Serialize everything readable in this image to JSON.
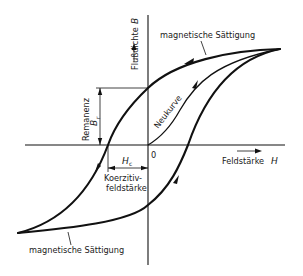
{
  "diagram": {
    "type": "hysteresis-loop",
    "axes": {
      "x_label": "Feldstärke",
      "x_symbol": "H",
      "y_label": "Flußdichte",
      "y_symbol": "B",
      "origin": "0"
    },
    "labels": {
      "saturation_top": "magnetische Sättigung",
      "saturation_bottom": "magnetische Sättigung",
      "new_curve": "Neukurve",
      "remanence": "Remanenz",
      "remanence_symbol": "B",
      "remanence_subscript": "r",
      "coercive_symbol": "H",
      "coercive_subscript": "c",
      "coercive_line1": "Koerzitiv-",
      "coercive_line2": "feldstärke"
    },
    "colors": {
      "line": "#111111",
      "background": "#ffffff"
    }
  }
}
